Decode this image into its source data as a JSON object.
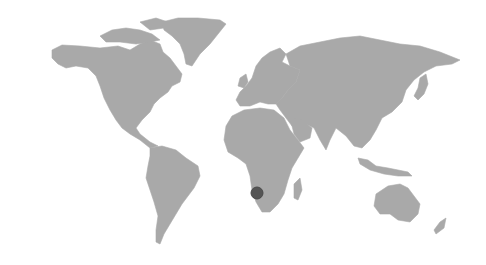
{
  "map": {
    "type": "world-map",
    "land_color": "#a9a9a9",
    "background_color": "#ffffff",
    "marker": {
      "region": "Namibia / southwestern Africa",
      "x": 257,
      "y": 193,
      "radius": 6,
      "color": "#555555"
    }
  }
}
